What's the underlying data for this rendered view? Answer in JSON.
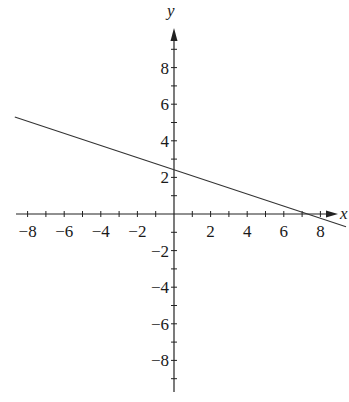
{
  "chart_data": {
    "type": "line",
    "title": "",
    "xlabel": "x",
    "ylabel": "y",
    "xlim": [
      -9,
      9
    ],
    "ylim": [
      -9.5,
      9.5
    ],
    "grid": false,
    "legend": null,
    "x_ticks": [
      -8,
      -6,
      -4,
      -2,
      2,
      4,
      6,
      8
    ],
    "y_ticks": [
      8,
      6,
      4,
      2,
      -2,
      -4,
      -6,
      -8
    ],
    "x_tick_labels": [
      "−8",
      "−6",
      "−4",
      "−2",
      "2",
      "4",
      "6",
      "8"
    ],
    "y_tick_labels": [
      "8",
      "6",
      "4",
      "2",
      "−2",
      "−4",
      "−6",
      "−8"
    ],
    "series": [
      {
        "name": "line",
        "equation": "y = -x/3 + 2.4",
        "slope": -0.333,
        "y_intercept": 2.4,
        "x_intercept": 7.2,
        "x": [
          -8.7,
          9.4
        ],
        "y": [
          5.3,
          -0.7
        ],
        "color": "#333333"
      }
    ]
  },
  "axes": {
    "x_label": "x",
    "y_label": "y"
  }
}
